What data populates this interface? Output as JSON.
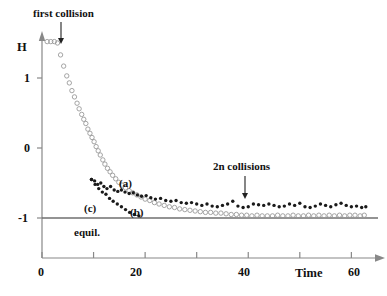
{
  "figure": {
    "background": "#ffffff",
    "ink": "#111111",
    "axis_color": "#888888",
    "open_marker_color": "#9a9a9a",
    "filled_marker_color": "#1a1a1a"
  },
  "annotations": {
    "first_collision": {
      "text": "first collision",
      "arrow_x": 61,
      "arrow_y_from": 22,
      "arrow_y_to": 44
    },
    "n_collisions": {
      "text": "2n collisions",
      "arrow_x": 245,
      "arrow_y_from": 176,
      "arrow_y_to": 199
    },
    "equilibrium": {
      "text": "equil."
    }
  },
  "curve_labels": {
    "a": "(a)",
    "b": "(b)",
    "c": "(c)"
  },
  "axes": {
    "y_name": "H",
    "x_name": "Time",
    "y_ticks": [
      "1",
      "0",
      "-1"
    ],
    "y_tick_values": [
      1,
      0,
      -1
    ],
    "x_ticks": [
      "0",
      "20",
      "40",
      "60"
    ],
    "x_tick_values": [
      0,
      20,
      40,
      60
    ],
    "x_minor_values": [
      10,
      30,
      50
    ],
    "xlim": [
      0,
      64
    ],
    "ylim": [
      -1.35,
      1.85
    ],
    "grid": false
  },
  "chart_data": {
    "type": "scatter",
    "title": "",
    "subtitle": "",
    "xlabel": "Time",
    "ylabel": "H",
    "xlim": [
      0,
      64
    ],
    "ylim": [
      -1.35,
      1.85
    ],
    "grid": false,
    "legend_position": "inline-annotations",
    "reference_lines": [
      {
        "name": "equil.",
        "axis": "y",
        "value": -1.0,
        "label": "equil."
      }
    ],
    "annotations": [
      {
        "text": "first collision",
        "x": 1.3,
        "y": 1.85
      },
      {
        "text": "2n collisions",
        "x": 36.5,
        "y": -0.35
      },
      {
        "text": "(a)",
        "x": 18.5,
        "y": -0.55
      },
      {
        "text": "(b)",
        "x": 20.5,
        "y": -0.97
      },
      {
        "text": "(c)",
        "x": 10.5,
        "y": -0.92
      }
    ],
    "series": [
      {
        "name": "(b)",
        "marker": "open-circle",
        "color": "#9a9a9a",
        "points": [
          [
            1.0,
            1.52
          ],
          [
            1.7,
            1.52
          ],
          [
            2.4,
            1.52
          ],
          [
            3.0,
            1.5
          ],
          [
            3.6,
            1.33
          ],
          [
            4.2,
            1.17
          ],
          [
            4.8,
            1.03
          ],
          [
            5.3,
            0.93
          ],
          [
            5.8,
            0.82
          ],
          [
            6.3,
            0.73
          ],
          [
            6.8,
            0.64
          ],
          [
            7.2,
            0.56
          ],
          [
            7.7,
            0.48
          ],
          [
            8.1,
            0.41
          ],
          [
            8.5,
            0.35
          ],
          [
            8.9,
            0.27
          ],
          [
            9.3,
            0.21
          ],
          [
            9.7,
            0.15
          ],
          [
            10.1,
            0.09
          ],
          [
            10.5,
            0.02
          ],
          [
            10.9,
            -0.04
          ],
          [
            11.3,
            -0.1
          ],
          [
            11.8,
            -0.17
          ],
          [
            12.2,
            -0.23
          ],
          [
            12.7,
            -0.29
          ],
          [
            13.2,
            -0.34
          ],
          [
            13.7,
            -0.39
          ],
          [
            14.3,
            -0.44
          ],
          [
            14.9,
            -0.49
          ],
          [
            15.5,
            -0.53
          ],
          [
            16.2,
            -0.57
          ],
          [
            16.9,
            -0.61
          ],
          [
            17.6,
            -0.64
          ],
          [
            18.4,
            -0.67
          ],
          [
            19.2,
            -0.7
          ],
          [
            20.0,
            -0.73
          ],
          [
            20.9,
            -0.75
          ],
          [
            21.8,
            -0.78
          ],
          [
            22.7,
            -0.8
          ],
          [
            23.7,
            -0.82
          ],
          [
            24.7,
            -0.84
          ],
          [
            25.7,
            -0.85
          ],
          [
            26.7,
            -0.87
          ],
          [
            27.7,
            -0.88
          ],
          [
            28.7,
            -0.89
          ],
          [
            29.7,
            -0.9
          ],
          [
            30.7,
            -0.91
          ],
          [
            31.7,
            -0.92
          ],
          [
            32.7,
            -0.92
          ],
          [
            33.7,
            -0.93
          ],
          [
            34.7,
            -0.93
          ],
          [
            35.7,
            -0.94
          ],
          [
            36.7,
            -0.95
          ],
          [
            37.7,
            -0.95
          ],
          [
            38.7,
            -0.96
          ],
          [
            39.7,
            -0.96
          ],
          [
            40.7,
            -0.97
          ],
          [
            41.7,
            -0.96
          ],
          [
            42.7,
            -0.97
          ],
          [
            43.7,
            -0.97
          ],
          [
            44.7,
            -0.97
          ],
          [
            45.7,
            -0.96
          ],
          [
            46.7,
            -0.97
          ],
          [
            47.7,
            -0.97
          ],
          [
            48.7,
            -0.96
          ],
          [
            49.7,
            -0.97
          ],
          [
            50.7,
            -0.97
          ],
          [
            51.7,
            -0.96
          ],
          [
            52.7,
            -0.97
          ],
          [
            53.7,
            -0.96
          ],
          [
            54.7,
            -0.97
          ],
          [
            55.7,
            -0.96
          ],
          [
            56.7,
            -0.97
          ],
          [
            57.7,
            -0.96
          ],
          [
            58.7,
            -0.97
          ],
          [
            59.7,
            -0.96
          ],
          [
            60.7,
            -0.96
          ],
          [
            61.7,
            -0.97
          ],
          [
            62.5,
            -0.96
          ]
        ]
      },
      {
        "name": "(a)",
        "marker": "filled-circle",
        "color": "#1a1a1a",
        "points": [
          [
            9.6,
            -0.45
          ],
          [
            10.2,
            -0.47
          ],
          [
            10.8,
            -0.52
          ],
          [
            11.4,
            -0.5
          ],
          [
            12.0,
            -0.55
          ],
          [
            12.6,
            -0.58
          ],
          [
            13.3,
            -0.55
          ],
          [
            14.0,
            -0.6
          ],
          [
            14.7,
            -0.62
          ],
          [
            15.4,
            -0.6
          ],
          [
            16.1,
            -0.63
          ],
          [
            16.9,
            -0.65
          ],
          [
            17.7,
            -0.64
          ],
          [
            18.5,
            -0.67
          ],
          [
            19.3,
            -0.69
          ],
          [
            20.2,
            -0.68
          ],
          [
            21.1,
            -0.71
          ],
          [
            22.0,
            -0.73
          ],
          [
            23.0,
            -0.72
          ],
          [
            24.0,
            -0.75
          ],
          [
            25.0,
            -0.76
          ],
          [
            26.0,
            -0.75
          ],
          [
            27.0,
            -0.78
          ],
          [
            28.0,
            -0.79
          ],
          [
            29.0,
            -0.78
          ],
          [
            30.0,
            -0.8
          ],
          [
            31.0,
            -0.82
          ],
          [
            32.0,
            -0.8
          ],
          [
            33.0,
            -0.83
          ],
          [
            34.0,
            -0.84
          ],
          [
            35.0,
            -0.82
          ],
          [
            36.0,
            -0.8
          ],
          [
            37.0,
            -0.76
          ],
          [
            38.0,
            -0.83
          ],
          [
            39.0,
            -0.85
          ],
          [
            40.0,
            -0.84
          ],
          [
            41.0,
            -0.8
          ],
          [
            42.0,
            -0.81
          ],
          [
            43.0,
            -0.82
          ],
          [
            44.0,
            -0.8
          ],
          [
            45.0,
            -0.82
          ],
          [
            46.0,
            -0.84
          ],
          [
            47.0,
            -0.83
          ],
          [
            48.0,
            -0.8
          ],
          [
            49.0,
            -0.82
          ],
          [
            50.0,
            -0.79
          ],
          [
            51.0,
            -0.84
          ],
          [
            52.0,
            -0.85
          ],
          [
            53.0,
            -0.83
          ],
          [
            54.0,
            -0.8
          ],
          [
            55.0,
            -0.82
          ],
          [
            56.0,
            -0.84
          ],
          [
            57.0,
            -0.81
          ],
          [
            58.0,
            -0.79
          ],
          [
            59.0,
            -0.82
          ],
          [
            60.0,
            -0.84
          ],
          [
            61.0,
            -0.83
          ],
          [
            62.0,
            -0.85
          ],
          [
            62.8,
            -0.84
          ]
        ]
      },
      {
        "name": "(c)",
        "marker": "filled-circle",
        "color": "#1a1a1a",
        "points": [
          [
            9.6,
            -0.45
          ],
          [
            10.3,
            -0.52
          ],
          [
            11.0,
            -0.58
          ],
          [
            11.7,
            -0.63
          ],
          [
            12.4,
            -0.66
          ],
          [
            13.1,
            -0.72
          ],
          [
            13.8,
            -0.76
          ],
          [
            14.6,
            -0.8
          ],
          [
            15.4,
            -0.84
          ],
          [
            16.2,
            -0.88
          ],
          [
            17.0,
            -0.92
          ],
          [
            17.9,
            -0.95
          ],
          [
            18.8,
            -0.97
          ]
        ]
      }
    ]
  }
}
